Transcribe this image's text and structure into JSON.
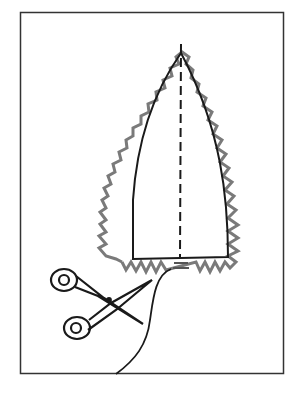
{
  "illustration": {
    "subject": "sewing pattern piece with pinked (zigzag) seam allowance being cut with scissors",
    "colors": {
      "background": "#ffffff",
      "outline": "#1a1a1a",
      "zigzag": "#7a7a7a",
      "frame": "#333333"
    },
    "elements": [
      "frame",
      "pattern-piece-outline",
      "center-dashed-line",
      "zigzag-pinked-edge",
      "scissors-icon",
      "cutting-line"
    ]
  }
}
